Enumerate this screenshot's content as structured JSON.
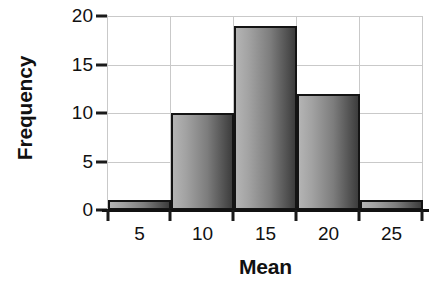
{
  "chart_data": {
    "type": "bar",
    "title": "",
    "subtitle": "",
    "xlabel": "Mean",
    "ylabel": "Frequency",
    "categories": [
      "5",
      "10",
      "15",
      "20",
      "25"
    ],
    "values": [
      1,
      10,
      19,
      12,
      1
    ],
    "bin_edges": [
      2.5,
      7.5,
      12.5,
      17.5,
      22.5,
      27.5
    ],
    "bin_width": 5,
    "xlim": [
      2.5,
      27.5
    ],
    "ylim": [
      0,
      20
    ],
    "x_ticks": [
      7.5,
      12.5,
      17.5,
      22.5
    ],
    "x_tick_labels": [
      "5",
      "10",
      "15",
      "20",
      "25"
    ],
    "y_ticks": [
      0,
      5,
      10,
      15,
      20
    ],
    "y_tick_labels": [
      "0",
      "5",
      "10",
      "15",
      "20"
    ],
    "grid": true,
    "grid_axis": "both",
    "legend": false,
    "legend_position": "none",
    "annotations": [],
    "colors": {
      "bar_gradient_light": "#b4b4b4",
      "bar_gradient_dark": "#3d3d3d",
      "bar_outline": "#141414",
      "grid_line": "#c9c9c9",
      "axis_line": "#111111",
      "text": "#111111",
      "background": "#ffffff"
    }
  }
}
